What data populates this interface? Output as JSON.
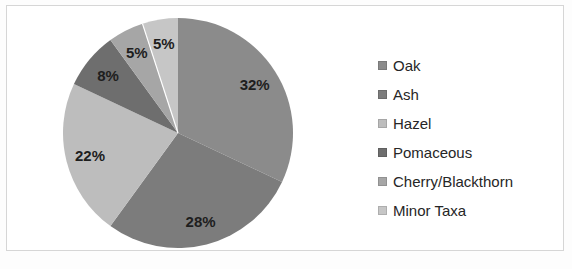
{
  "frame": {
    "background": "#ffffff",
    "border_color": "#d6d6d6"
  },
  "chart_data": {
    "type": "pie",
    "title": "",
    "categories": [
      "Oak",
      "Ash",
      "Hazel",
      "Pomaceous",
      "Cherry/Blackthorn",
      "Minor Taxa"
    ],
    "values": [
      32,
      28,
      22,
      8,
      5,
      5
    ],
    "data_labels": [
      "32%",
      "28%",
      "22%",
      "8%",
      "5%",
      "5%"
    ],
    "colors": [
      "#8b8b8b",
      "#7c7c7c",
      "#bdbdbd",
      "#6e6e6e",
      "#a6a6a6",
      "#c6c6c6"
    ],
    "start_angle_deg": 0,
    "direction": "clockwise",
    "label_color": "#1e1e1e",
    "slice_divider_color": "#ffffff",
    "legend_position": "right",
    "grid": false
  }
}
